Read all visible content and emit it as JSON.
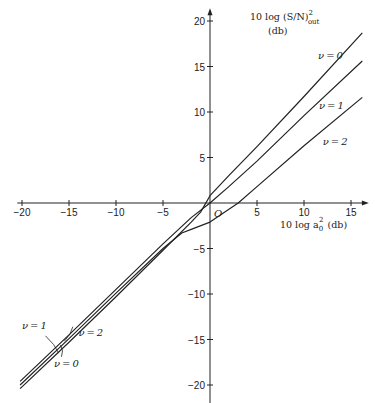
{
  "chart_data": {
    "type": "line",
    "title": "",
    "xlabel": "10 log a0^2 (db)",
    "ylabel": "10 log (S/N)^2 out (db)",
    "xlim": [
      -20.5,
      16.5
    ],
    "ylim": [
      -22,
      21
    ],
    "grid": false,
    "origin_label": "O",
    "x_ticks": [
      -20,
      -15,
      -10,
      -5,
      5,
      10,
      15
    ],
    "y_ticks": [
      20,
      15,
      10,
      5,
      -5,
      -10,
      -15,
      -20
    ],
    "series": [
      {
        "name": "ν=0",
        "x": [
          -20.2,
          -15,
          -10,
          -5,
          -2,
          -1,
          0,
          2,
          5,
          10,
          16.2
        ],
        "y": [
          -20.4,
          -15.3,
          -10.3,
          -5.2,
          -2.1,
          -1.0,
          0.8,
          3.0,
          6.2,
          11.7,
          18.7
        ]
      },
      {
        "name": "ν=1",
        "x": [
          -20.2,
          -15,
          -10,
          -5,
          -2,
          0,
          2,
          5,
          10,
          16.2
        ],
        "y": [
          -19.6,
          -14.5,
          -9.5,
          -4.5,
          -1.6,
          0.0,
          1.8,
          4.6,
          9.6,
          15.6
        ]
      },
      {
        "name": "ν=2",
        "x": [
          -20.2,
          -15,
          -10,
          -5,
          -3,
          -2,
          0,
          3,
          5,
          10,
          16.2
        ],
        "y": [
          -20.0,
          -14.9,
          -9.9,
          -5.0,
          -3.3,
          -2.9,
          -2.1,
          0.0,
          1.8,
          6.3,
          11.6
        ]
      }
    ],
    "annotations": [
      {
        "text": "ν=0",
        "x": 11.5,
        "y": 15.8
      },
      {
        "text": "ν=1",
        "x": 11.6,
        "y": 10.3
      },
      {
        "text": "ν=2",
        "x": 12.0,
        "y": 6.4
      },
      {
        "text": "ν=1",
        "x": -20.0,
        "y": -13.9
      },
      {
        "text": "ν=2",
        "x": -14.0,
        "y": -14.6
      },
      {
        "text": "ν=0",
        "x": -16.6,
        "y": -18.0
      }
    ]
  },
  "labels": {
    "y_title_line1": "10 log (S/N)",
    "y_title_sup": "2",
    "y_title_sub": "out",
    "y_title_line2": "(db)",
    "x_title": "10 log a",
    "x_title_sub": "0",
    "x_title_sup": "2",
    "x_title_unit": "(db)",
    "origin": "O"
  }
}
